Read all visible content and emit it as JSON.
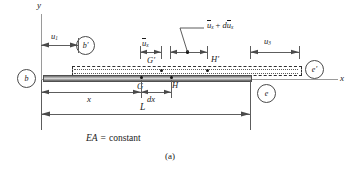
{
  "figure": {
    "caption": "(a)",
    "material_note": "EA = constant",
    "note_prefix": "EA",
    "note_equals": "=",
    "note_value": "constant"
  },
  "axes": {
    "y_label": "y",
    "x_label": "x"
  },
  "nodes": [
    {
      "id": "node-b",
      "label": "b"
    },
    {
      "id": "node-b-prime",
      "label": "b′"
    },
    {
      "id": "node-e",
      "label": "e"
    },
    {
      "id": "node-e-prime",
      "label": "e′"
    }
  ],
  "points": [
    {
      "id": "point-G",
      "label": "G"
    },
    {
      "id": "point-H",
      "label": "H"
    },
    {
      "id": "point-G-prime",
      "label": "G′"
    },
    {
      "id": "point-H-prime",
      "label": "H′"
    }
  ],
  "displacements": {
    "left_node": {
      "base": "u",
      "sub": "1"
    },
    "at_G": {
      "base": "u",
      "sub": "x"
    },
    "at_H": {
      "base": "u",
      "sub": "x",
      "suffix_op": "+",
      "suffix_d": "d",
      "suffix_base": "u",
      "suffix_sub": "x"
    },
    "right_node": {
      "base": "u",
      "sub": "3"
    }
  },
  "dimensions": [
    {
      "id": "dim-x",
      "label": "x"
    },
    {
      "id": "dim-dx",
      "label": "dx"
    },
    {
      "id": "dim-L",
      "label": "L"
    }
  ],
  "colors": {
    "ink": "#1a1a1a",
    "axis": "#9a9a9a",
    "dim": "#5d5d5d",
    "bar_edge": "#4f4f4f",
    "dashed": "#2f2f2f",
    "background": "#ffffff"
  }
}
